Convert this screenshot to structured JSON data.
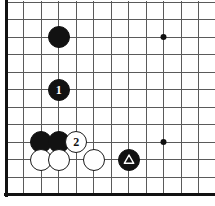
{
  "figure": {
    "kind": "go-board-diagram",
    "width_px": 215,
    "height_px": 206,
    "background_color": "#ffffff"
  },
  "board": {
    "origin_x": 6,
    "origin_y": 2,
    "spacing": 17.5,
    "cols": 12,
    "rows": 11,
    "line_color": "#5a5a5a",
    "line_width": 1,
    "edge_color": "#111111",
    "edge_width": 3,
    "edges": [
      "left",
      "bottom"
    ],
    "star_point_color": "#111111",
    "star_point_radius": 3,
    "star_points": [
      {
        "name": "star-point-upper-right",
        "col": 9,
        "row": 2
      },
      {
        "name": "star-point-lower-right",
        "col": 9,
        "row": 8
      }
    ]
  },
  "stones": [
    {
      "name": "black-stone-upper",
      "color": "black",
      "color_hex": "#121212",
      "col": 3,
      "row": 2,
      "radius": 11,
      "label": "",
      "mark": ""
    },
    {
      "name": "black-stone-move-1",
      "color": "black",
      "color_hex": "#121212",
      "col": 3,
      "row": 5,
      "radius": 11,
      "label": "1",
      "mark": ""
    },
    {
      "name": "black-stone-left",
      "color": "black",
      "color_hex": "#121212",
      "col": 2,
      "row": 8,
      "radius": 11,
      "label": "",
      "mark": ""
    },
    {
      "name": "black-stone-center",
      "color": "black",
      "color_hex": "#121212",
      "col": 3,
      "row": 8,
      "radius": 11,
      "label": "",
      "mark": ""
    },
    {
      "name": "white-stone-move-2",
      "color": "white",
      "color_hex": "#ffffff",
      "col": 4,
      "row": 8,
      "radius": 11,
      "label": "2",
      "mark": ""
    },
    {
      "name": "white-stone-bottom-left",
      "color": "white",
      "color_hex": "#ffffff",
      "col": 2,
      "row": 9,
      "radius": 11,
      "label": "",
      "mark": ""
    },
    {
      "name": "white-stone-bottom-center",
      "color": "white",
      "color_hex": "#ffffff",
      "col": 3,
      "row": 9,
      "radius": 11,
      "label": "",
      "mark": ""
    },
    {
      "name": "white-stone-bottom-right",
      "color": "white",
      "color_hex": "#ffffff",
      "col": 5,
      "row": 9,
      "radius": 11,
      "label": "",
      "mark": ""
    },
    {
      "name": "black-stone-triangle-marked",
      "color": "black",
      "color_hex": "#121212",
      "col": 7,
      "row": 9,
      "radius": 11,
      "label": "",
      "mark": "triangle"
    }
  ]
}
